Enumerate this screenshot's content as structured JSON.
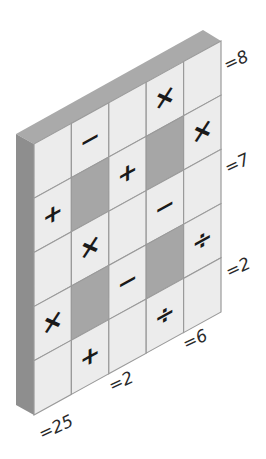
{
  "puzzle": {
    "title": "Math grid puzzle",
    "rows": 5,
    "cols": 5,
    "cells": [
      [
        "",
        "−",
        "",
        "×",
        ""
      ],
      [
        "+",
        "#",
        "+",
        "#",
        "×"
      ],
      [
        "",
        "×",
        "",
        "−",
        ""
      ],
      [
        "×",
        "#",
        "−",
        "#",
        "÷"
      ],
      [
        "",
        "+",
        "",
        "÷",
        ""
      ]
    ],
    "row_results": [
      "=8",
      "=7",
      "=2"
    ],
    "col_results": [
      "=25",
      "=2",
      "=6"
    ]
  },
  "colors": {
    "cell_face": "#ececec",
    "blocked_cell": "#a6a6a6",
    "grid_line": "#9a9a9a",
    "top_bevel": "#aaaaaa",
    "side_bevel": "#8c8c8c",
    "text": "#1a1a1a"
  }
}
